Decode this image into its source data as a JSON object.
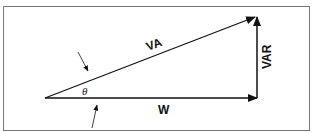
{
  "diagram": {
    "type": "power-triangle",
    "labels": {
      "hypotenuse": "VA",
      "base": "W",
      "vertical": "VAR",
      "angle": "θ"
    },
    "colors": {
      "line": "#111111",
      "frame": "#777777",
      "background": "#ffffff"
    }
  }
}
